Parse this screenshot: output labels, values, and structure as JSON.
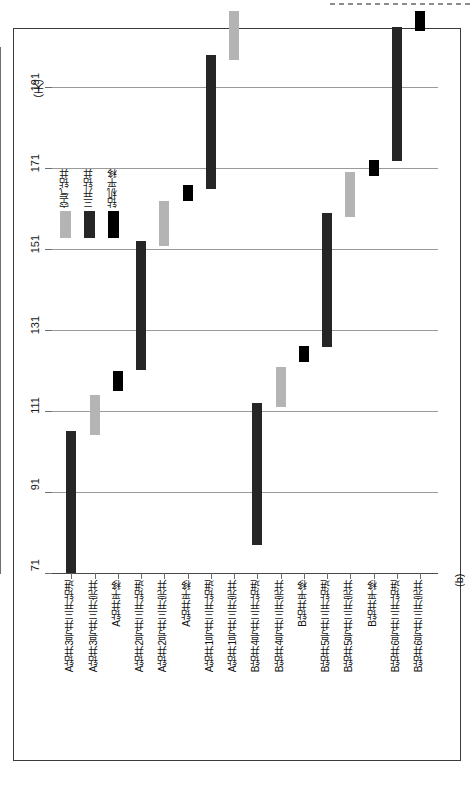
{
  "figure": {
    "caption": "(b)",
    "axis_unit": "（天）"
  },
  "chart_data": {
    "type": "bar",
    "title": "",
    "orientation": "vertical-floating",
    "xlabel": "",
    "ylabel": "（天）",
    "ylim": [
      71,
      201
    ],
    "yticks": [
      71,
      91,
      111,
      131,
      151,
      171,
      191
    ],
    "grid": true,
    "legend_position": "inside-left",
    "legend": [
      {
        "label": "空气钻井",
        "color": "#b4b4b4"
      },
      {
        "label": "三开钻井",
        "color": "#262626"
      },
      {
        "label": "钻机平移",
        "color": "#000000"
      }
    ],
    "categories": [
      "A钻井3号井三开钻进",
      "A钻井3号井三开完井",
      "A钻井平移",
      "A钻井2号井三开钻进",
      "A钻井2号井三开完井",
      "A钻井平移",
      "A钻井1号井三开钻进",
      "A钻井1号井三开完井",
      "B钻井4号井三开钻进",
      "B钻井4号井三开完井",
      "B钻井平移",
      "B钻井5号井三开钻进",
      "B钻井5号井三开完井",
      "B钻井平移",
      "B钻井6号井三开钻进",
      "B钻井6号井三开完井"
    ],
    "bars": [
      {
        "category": "A钻井3号井三开钻进",
        "start": 71,
        "end": 106,
        "series": "三开钻井",
        "color": "#262626"
      },
      {
        "category": "A钻井3号井三开完井",
        "start": 105,
        "end": 115,
        "series": "空气钻井",
        "color": "#b4b4b4"
      },
      {
        "category": "A钻井平移",
        "start": 116,
        "end": 121,
        "series": "钻机平移",
        "color": "#000000"
      },
      {
        "category": "A钻井2号井三开钻进",
        "start": 121,
        "end": 153,
        "series": "三开钻井",
        "color": "#262626"
      },
      {
        "category": "A钻井2号井三开完井",
        "start": 152,
        "end": 163,
        "series": "空气钻井",
        "color": "#b4b4b4"
      },
      {
        "category": "A钻井平移",
        "start": 163,
        "end": 167,
        "series": "钻机平移",
        "color": "#000000"
      },
      {
        "category": "A钻井1号井三开钻进",
        "start": 166,
        "end": 199,
        "series": "三开钻井",
        "color": "#262626"
      },
      {
        "category": "A钻井1号井三开完井",
        "start": 198,
        "end": 210,
        "series": "空气钻井",
        "color": "#b4b4b4"
      },
      {
        "category": "B钻井4号井三开钻进",
        "start": 78,
        "end": 113,
        "series": "三开钻井",
        "color": "#262626"
      },
      {
        "category": "B钻井4号井三开完井",
        "start": 112,
        "end": 122,
        "series": "空气钻井",
        "color": "#b4b4b4"
      },
      {
        "category": "B钻井平移",
        "start": 123,
        "end": 127,
        "series": "钻机平移",
        "color": "#000000"
      },
      {
        "category": "B钻井5号井三开钻进",
        "start": 127,
        "end": 160,
        "series": "三开钻井",
        "color": "#262626"
      },
      {
        "category": "B钻井5号井三开完井",
        "start": 159,
        "end": 170,
        "series": "空气钻井",
        "color": "#b4b4b4"
      },
      {
        "category": "B钻井平移",
        "start": 169,
        "end": 173,
        "series": "钻机平移",
        "color": "#000000"
      },
      {
        "category": "B钻井6号井三开钻进",
        "start": 173,
        "end": 206,
        "series": "三开钻井",
        "color": "#262626"
      },
      {
        "category": "B钻井6号井三开完井",
        "start": 205,
        "end": 210,
        "series": "钻机平移",
        "color": "#000000"
      }
    ]
  }
}
